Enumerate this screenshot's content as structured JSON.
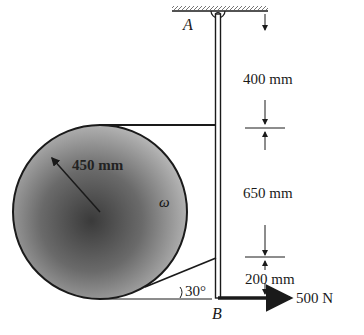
{
  "diagram": {
    "points": {
      "A": "A",
      "B": "B"
    },
    "dimensions": [
      {
        "id": "seg1",
        "label": "400 mm"
      },
      {
        "id": "seg2",
        "label": "650 mm"
      },
      {
        "id": "seg3",
        "label": "200 mm"
      }
    ],
    "radius_label": "450 mm",
    "angular_velocity_label": "ω",
    "angle_label": "30°",
    "force_label": "500 N",
    "colors": {
      "line": "#1a1a1a",
      "disk_light": "#d8d8d8",
      "disk_dark": "#3a3a3a"
    }
  }
}
